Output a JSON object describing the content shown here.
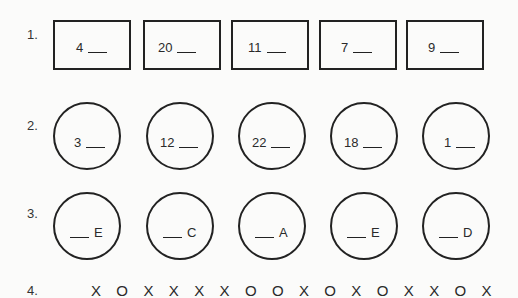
{
  "problems": [
    {
      "number": "1.",
      "shape": "rectangle",
      "items": [
        "4",
        "20",
        "11",
        "7",
        "9"
      ],
      "blank_position": "after"
    },
    {
      "number": "2.",
      "shape": "circle",
      "items": [
        "3",
        "12",
        "22",
        "18",
        "1"
      ],
      "blank_position": "after"
    },
    {
      "number": "3.",
      "shape": "circle",
      "items": [
        "E",
        "C",
        "A",
        "E",
        "D"
      ],
      "blank_position": "before"
    },
    {
      "number": "4.",
      "shape": "sequence",
      "sequence": "X O X X X X O O X O X O X X O X"
    }
  ]
}
